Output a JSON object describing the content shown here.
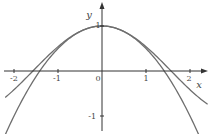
{
  "chart_data": {
    "type": "line",
    "title": "",
    "xlabel": "x",
    "ylabel": "y",
    "xlim": [
      -2.2,
      2.4
    ],
    "ylim": [
      -1.4,
      1.5
    ],
    "grid": false,
    "legend": null,
    "x_ticks": [
      -2,
      -1,
      0,
      1,
      2
    ],
    "x_tick_labels": [
      "-2",
      "-1",
      "0",
      "1",
      "2"
    ],
    "y_ticks": [
      1,
      -1
    ],
    "y_tick_labels": [
      "1",
      "-1"
    ],
    "series": [
      {
        "name": "cos(x)",
        "x": [
          -2.2,
          -2,
          -1.5,
          -1,
          -0.5,
          0,
          0.5,
          1,
          1.5,
          2,
          2.4
        ],
        "values": [
          -0.589,
          -0.416,
          0.071,
          0.54,
          0.878,
          1.0,
          0.878,
          0.54,
          0.071,
          -0.416,
          -0.737
        ]
      },
      {
        "name": "1 - x^2/2",
        "x": [
          -2.2,
          -2,
          -1.5,
          -1,
          -0.5,
          0,
          0.5,
          1,
          1.5,
          2,
          2.2
        ],
        "values": [
          -1.42,
          -1.0,
          -0.125,
          0.5,
          0.875,
          1.0,
          0.875,
          0.5,
          -0.125,
          -1.0,
          -1.42
        ]
      }
    ],
    "colors": {
      "axis": "#333333",
      "curve": "#6e6e6e",
      "text": "#444444"
    }
  },
  "axes": {
    "x_label": "x",
    "y_label": "y",
    "origin_label": "0",
    "x_tick_labels": [
      "-2",
      "-1",
      "1",
      "2"
    ],
    "y_tick_labels": [
      "1",
      "-1"
    ]
  }
}
